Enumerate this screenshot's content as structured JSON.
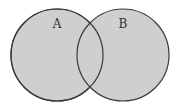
{
  "diagram": {
    "type": "venn",
    "sets": [
      {
        "label": "A",
        "cx": 57,
        "cy": 55,
        "r": 46
      },
      {
        "label": "B",
        "cx": 123,
        "cy": 55,
        "r": 46
      }
    ],
    "colors": {
      "fill": "#cfcfcf",
      "stroke": "#3a3a3a",
      "label": "#333333",
      "background": "#ffffff"
    }
  }
}
